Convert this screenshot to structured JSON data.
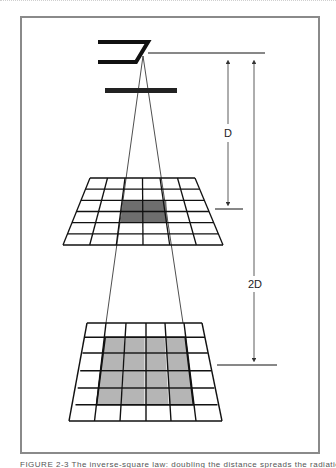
{
  "figure": {
    "labels": {
      "d": "D",
      "two_d": "2D"
    },
    "caption": "FIGURE 2-3 The inverse-square law: doubling the distance spreads the radiation over four times the area",
    "colors": {
      "frame": "#8a8a8a",
      "line": "#111111",
      "upper_highlight": "#6e6e6e",
      "lower_highlight": "#b5b5b5"
    },
    "upper_grid": {
      "rows": 6,
      "cols": 6,
      "highlight_cells": "2x2 center"
    },
    "lower_grid": {
      "rows": 6,
      "cols": 6,
      "highlight_cells": "4x4 center"
    }
  }
}
